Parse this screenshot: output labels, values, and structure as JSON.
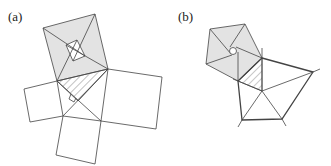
{
  "panels": [
    {
      "id": "a",
      "label": "(a)",
      "description": "Pythagorean dissection with squares on the sides of a right triangle"
    },
    {
      "id": "b",
      "label": "(b)",
      "description": "Analogous dissection using regular pentagons on the sides of a triangle"
    }
  ],
  "colors": {
    "stroke": "#444444",
    "shade": "#e3e3e3",
    "hatch": "#777777",
    "background": "#ffffff"
  }
}
